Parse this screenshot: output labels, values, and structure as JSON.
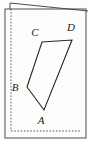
{
  "figure": {
    "background_color": "#fdfdfc",
    "stroke_color": "#262626",
    "frame": {
      "name": "page-border",
      "style": "solid",
      "x": 5,
      "y": 9,
      "width": 81,
      "height": 129
    },
    "fold_line": {
      "name": "page-fold-line",
      "style": "solid",
      "from": [
        10,
        3
      ],
      "to": [
        88,
        11
      ]
    },
    "fold_left_tick": {
      "name": "page-fold-left-edge",
      "from": [
        10,
        3
      ],
      "to": [
        10,
        9
      ]
    },
    "margin_guides": [
      {
        "name": "left-margin-guide",
        "style": "dashed",
        "from": [
          11,
          9
        ],
        "to": [
          11,
          131
        ]
      },
      {
        "name": "bottom-margin-guide",
        "style": "dashed",
        "from": [
          11,
          131
        ],
        "to": [
          81,
          131
        ]
      }
    ],
    "shape": {
      "name": "quadrilateral-abcd",
      "type": "quadrilateral",
      "fill": "none",
      "stroke_width": 1.1,
      "vertices": [
        {
          "id": "A",
          "x": 44,
          "y": 110,
          "label": "A",
          "label_x": 41,
          "label_y": 124
        },
        {
          "id": "B",
          "x": 27,
          "y": 87,
          "label": "B",
          "label_x": 15,
          "label_y": 91
        },
        {
          "id": "C",
          "x": 42,
          "y": 42,
          "label": "C",
          "label_x": 35,
          "label_y": 36
        },
        {
          "id": "D",
          "x": 72,
          "y": 40,
          "label": "D",
          "label_x": 71,
          "label_y": 31
        }
      ],
      "edges": [
        {
          "name": "edge-A-B",
          "from": "A",
          "to": "B"
        },
        {
          "name": "edge-B-C",
          "from": "B",
          "to": "C"
        },
        {
          "name": "edge-C-D",
          "from": "C",
          "to": "D"
        },
        {
          "name": "edge-D-A",
          "from": "D",
          "to": "A"
        }
      ]
    }
  }
}
